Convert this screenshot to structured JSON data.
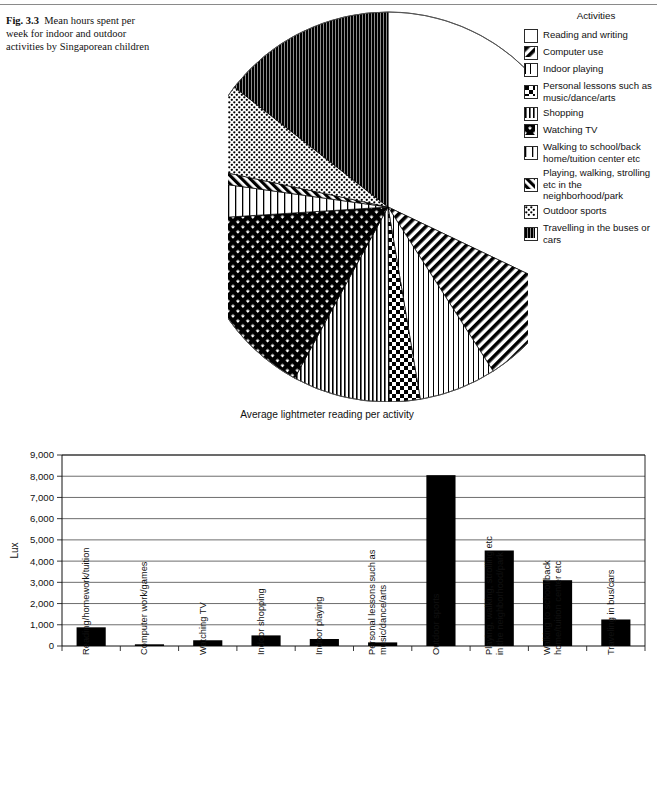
{
  "caption": {
    "fig_label": "Fig. 3.3",
    "text": "Mean hours spent per week for indoor and outdoor activities by Singaporean children"
  },
  "legend": {
    "title": "Activities",
    "items": [
      {
        "label": "Reading and writing",
        "pattern": "blank"
      },
      {
        "label": "Computer use",
        "pattern": "diag-thick-fwd"
      },
      {
        "label": "Indoor playing",
        "pattern": "vlines-sparse"
      },
      {
        "label": "Personal lessons such as music/dance/arts",
        "pattern": "checker"
      },
      {
        "label": "Shopping",
        "pattern": "vlines-med"
      },
      {
        "label": "Watching TV",
        "pattern": "crosshatch-dense"
      },
      {
        "label": "Walking to school/back home/tuition center etc",
        "pattern": "vlines-wide"
      },
      {
        "label": "Playing, walking, strolling etc in the neighborhood/park",
        "pattern": "diag-back"
      },
      {
        "label": "Outdoor sports",
        "pattern": "dots-light"
      },
      {
        "label": "Travelling in the buses or cars",
        "pattern": "vlines-black"
      }
    ]
  },
  "chart_data": [
    {
      "type": "pie",
      "title": "",
      "legend_position": "right",
      "categories": [
        "Reading and writing",
        "Computer use",
        "Indoor playing",
        "Personal lessons such as music/dance/arts",
        "Shopping",
        "Watching TV",
        "Walking to school/back home/tuition center etc",
        "Playing, walking, strolling etc in the neighborhood/park",
        "Outdoor sports",
        "Travelling in the buses or cars"
      ],
      "values": [
        20.0,
        5.5,
        4.0,
        1.6,
        5.0,
        10.0,
        2.0,
        0.7,
        4.5,
        9.0
      ],
      "unit": "hours per week",
      "slice_order_clockwise_from_top": [
        "Reading and writing",
        "Computer use",
        "Indoor playing",
        "Personal lessons such as music/dance/arts",
        "Shopping",
        "Watching TV",
        "Walking to school/back home/tuition center etc",
        "Playing, walking, strolling etc in the neighborhood/park",
        "Outdoor sports",
        "Travelling in the buses or cars"
      ]
    },
    {
      "type": "bar",
      "title": "Average lightmeter reading per activity",
      "xlabel": "",
      "ylabel": "Lux",
      "ylim": [
        0,
        9000
      ],
      "ytick_labels": [
        "0",
        "1,000",
        "2,000",
        "3,000",
        "4,000",
        "5,000",
        "6,000",
        "7,000",
        "8,000",
        "9,000"
      ],
      "ytick_values": [
        0,
        1000,
        2000,
        3000,
        4000,
        5000,
        6000,
        7000,
        8000,
        9000
      ],
      "grid": true,
      "categories": [
        "Reading/homework/tuition",
        "Computer work/games",
        "Watching TV",
        "Indoor shopping",
        "Indoor playing",
        "Personal lessons such as music/dance/arts",
        "Outdoor sports",
        "Playing, walking, strolling etc in the neighborhood/park",
        "Walking to school/back home/tuition center etc",
        "Traveling in bus/cars"
      ],
      "values": [
        880,
        80,
        270,
        500,
        330,
        170,
        8050,
        4500,
        3100,
        1250
      ],
      "bar_color": "#000000"
    }
  ]
}
